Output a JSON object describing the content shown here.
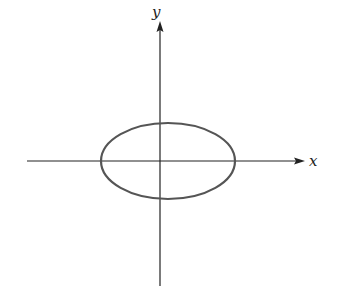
{
  "diagram": {
    "type": "ellipse-on-axes",
    "x_axis_label": "x",
    "y_axis_label": "y",
    "origin": [
      160,
      161
    ],
    "ellipse": {
      "cx": 168,
      "cy": 161,
      "rx": 67,
      "ry": 38
    },
    "stroke_color": "#555555",
    "axis_color": "#222222"
  }
}
